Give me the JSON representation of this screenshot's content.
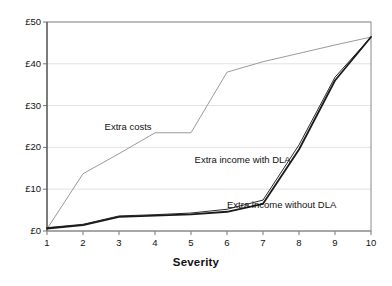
{
  "chart_data": {
    "type": "line",
    "title": "",
    "xlabel": "Severity",
    "ylabel": "",
    "xlim": [
      1,
      10
    ],
    "ylim": [
      0,
      50
    ],
    "grid": true,
    "legend_position": "inline-annotations",
    "x": [
      1,
      2,
      3,
      4,
      5,
      6,
      7,
      8,
      9,
      10
    ],
    "xticklabels": [
      "1",
      "2",
      "3",
      "4",
      "5",
      "6",
      "7",
      "8",
      "9",
      "10"
    ],
    "yticks": [
      0,
      10,
      20,
      30,
      40,
      50
    ],
    "yticklabels": [
      "£0",
      "£10",
      "£20",
      "£30",
      "£40",
      "£50"
    ],
    "series": [
      {
        "name": "Extra costs",
        "color": "#9a9a9a",
        "width": 1.0,
        "values": [
          0.5,
          13.7,
          18.5,
          23.5,
          23.5,
          38.0,
          40.5,
          42.5,
          44.5,
          46.4
        ]
      },
      {
        "name": "Extra income with DLA",
        "color": "#2b2b2b",
        "width": 1.0,
        "values": [
          0.8,
          1.6,
          3.6,
          3.9,
          4.3,
          5.2,
          7.4,
          20.6,
          36.8,
          46.4
        ]
      },
      {
        "name": "Extra income without DLA",
        "color": "#1a1a1a",
        "width": 1.8,
        "values": [
          0.6,
          1.4,
          3.4,
          3.7,
          4.0,
          4.6,
          6.5,
          19.5,
          36.0,
          46.4
        ]
      }
    ],
    "annotations": [
      {
        "text": "Extra costs",
        "x": 2.6,
        "y": 25.0
      },
      {
        "text": "Extra income with DLA",
        "x": 5.1,
        "y": 17.0
      },
      {
        "text": "Extra income without DLA",
        "x": 6.0,
        "y": 6.2
      }
    ],
    "colors": {
      "axis": "#777777",
      "grid": "#e2e2e2",
      "border": "#8a8a8a",
      "background": "#ffffff"
    }
  }
}
